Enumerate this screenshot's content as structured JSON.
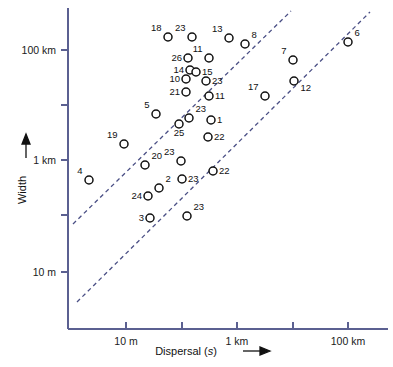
{
  "chart_data": {
    "type": "scatter",
    "title": "",
    "xlabel": "Dispersal (s)",
    "ylabel": "Width",
    "xlabel_arrow": "⟶",
    "ylabel_arrow": "↑",
    "x_scale": "log",
    "y_scale": "log",
    "xticks_labeled": [
      "10 m",
      "1 km",
      "100 km"
    ],
    "yticks_labeled": [
      "100 km",
      "1 km",
      "10 m"
    ],
    "grid": false,
    "legend": "none",
    "points": [
      {
        "id": "18",
        "px": 168,
        "py": 37,
        "label_pos": "upper-left"
      },
      {
        "id": "23",
        "px": 192,
        "py": 37,
        "label_pos": "upper-left"
      },
      {
        "id": "13",
        "px": 229,
        "py": 38,
        "label_pos": "upper-left"
      },
      {
        "id": "8",
        "px": 245,
        "py": 44,
        "label_pos": "upper-right"
      },
      {
        "id": "6",
        "px": 348,
        "py": 42,
        "label_pos": "upper-right"
      },
      {
        "id": "26",
        "px": 188,
        "py": 58,
        "label_pos": "left"
      },
      {
        "id": "11",
        "px": 209,
        "py": 58,
        "label_pos": "upper-left"
      },
      {
        "id": "7",
        "px": 293,
        "py": 60,
        "label_pos": "upper-left"
      },
      {
        "id": "14",
        "px": 190,
        "py": 70,
        "label_pos": "left"
      },
      {
        "id": "15",
        "px": 196,
        "py": 72,
        "label_pos": "right"
      },
      {
        "id": "10",
        "px": 186,
        "py": 79,
        "label_pos": "left"
      },
      {
        "id": "23",
        "px": 206,
        "py": 81,
        "label_pos": "right"
      },
      {
        "id": "12",
        "px": 294,
        "py": 81,
        "label_pos": "lower-right"
      },
      {
        "id": "21",
        "px": 186,
        "py": 92,
        "label_pos": "left"
      },
      {
        "id": "11",
        "px": 209,
        "py": 96,
        "label_pos": "right"
      },
      {
        "id": "17",
        "px": 265,
        "py": 96,
        "label_pos": "upper-left"
      },
      {
        "id": "5",
        "px": 156,
        "py": 114,
        "label_pos": "upper-left"
      },
      {
        "id": "23",
        "px": 189,
        "py": 118,
        "label_pos": "upper-right"
      },
      {
        "id": "1",
        "px": 211,
        "py": 120,
        "label_pos": "right"
      },
      {
        "id": "25",
        "px": 179,
        "py": 124,
        "label_pos": "below"
      },
      {
        "id": "22",
        "px": 208,
        "py": 137,
        "label_pos": "right"
      },
      {
        "id": "19",
        "px": 124,
        "py": 144,
        "label_pos": "upper-left"
      },
      {
        "id": "23",
        "px": 181,
        "py": 161,
        "label_pos": "upper-left"
      },
      {
        "id": "20",
        "px": 145,
        "py": 165,
        "label_pos": "upper-right"
      },
      {
        "id": "22",
        "px": 213,
        "py": 171,
        "label_pos": "right"
      },
      {
        "id": "4",
        "px": 89,
        "py": 180,
        "label_pos": "upper-left"
      },
      {
        "id": "23",
        "px": 182,
        "py": 179,
        "label_pos": "right"
      },
      {
        "id": "2",
        "px": 159,
        "py": 188,
        "label_pos": "upper-right"
      },
      {
        "id": "24",
        "px": 148,
        "py": 196,
        "label_pos": "left"
      },
      {
        "id": "3",
        "px": 150,
        "py": 218,
        "label_pos": "left"
      },
      {
        "id": "23",
        "px": 187,
        "py": 216,
        "label_pos": "upper-right"
      }
    ],
    "trend_lines": [
      {
        "name": "upper-bound",
        "x1": 73,
        "y1": 224,
        "x2": 291,
        "y2": 11,
        "style": "dashed"
      },
      {
        "name": "lower-bound",
        "x1": 77,
        "y1": 302,
        "x2": 370,
        "y2": 12,
        "style": "dashed"
      }
    ],
    "axes_geometry": {
      "x_axis_y": 329,
      "y_axis_x": 68,
      "plot_left": 68,
      "plot_right": 388,
      "plot_top": 8,
      "plot_bottom": 329,
      "x_tick_positions": [
        126,
        182,
        237,
        293,
        348
      ],
      "y_tick_positions": [
        50,
        105,
        160,
        215,
        272
      ]
    },
    "colors": {
      "axis": "#5b6091",
      "trend_line": "#4a4f85",
      "marker_stroke": "#111111",
      "marker_fill": "#ffffff",
      "text": "#1a1a1a",
      "background": "#ffffff"
    }
  }
}
